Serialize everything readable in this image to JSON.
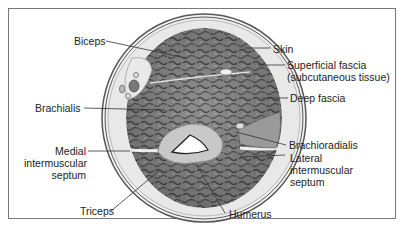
{
  "diagram": {
    "type": "anatomical cross-section",
    "labels_left": [
      {
        "id": "biceps",
        "text": "Biceps"
      },
      {
        "id": "brachialis",
        "text": "Brachialis"
      },
      {
        "id": "medial-septum",
        "lines": [
          "Medial",
          "intermuscular",
          "septum"
        ]
      },
      {
        "id": "triceps",
        "text": "Triceps"
      }
    ],
    "labels_right": [
      {
        "id": "skin",
        "text": "Skin"
      },
      {
        "id": "superficial-fascia",
        "lines": [
          "Superficial fascia",
          "(subcutaneous tissue)"
        ]
      },
      {
        "id": "deep-fascia",
        "text": "Deep fascia"
      },
      {
        "id": "brachioradialis",
        "text": "Brachioradialis"
      },
      {
        "id": "lateral-septum",
        "lines": [
          "Lateral",
          "intermuscular",
          "septum"
        ]
      }
    ],
    "labels_bottom": [
      {
        "id": "humerus",
        "text": "Humerus"
      }
    ],
    "colors": {
      "frame": "#777777",
      "skin_line": "#555555",
      "subcutaneous": "#e6e6e6",
      "muscle": "#8a8a8a",
      "muscle_texture": "#4a4a4a",
      "bone": "#c8c8c8",
      "marrow": "#ffffff",
      "leader": "#333333"
    }
  }
}
